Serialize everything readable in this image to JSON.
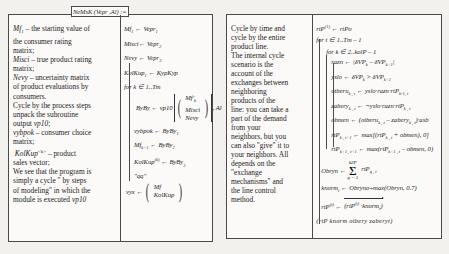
{
  "figure": {
    "kind": "mathcad-pseudocode-figure",
    "panels": 2
  },
  "left_panel": {
    "header": "NeMsK (Vepr ,Al) :=",
    "description": {
      "paragraphs": [
        "Mf1 – the starting value of the consumer rating matrix;",
        "Misci – true product rating matrix;",
        "Nevy – uncertainty matrix of product evaluations by consumers.",
        "Cycle by the process steps unpack the subroutine output vp10;",
        "vybpok – consumer choice matrix;",
        "KolKup<k> – product sales vector;",
        "We see that the program is simply a cycle \" by steps of modeling\" in which the module is executed vp10"
      ],
      "lines": [
        "Mf1 – the starting value of",
        "the consumer rating",
        "matrix;",
        "Misci – true product rating",
        "matrix;",
        "Nevy – uncertainty matrix",
        "of product evaluations by",
        "consumers.",
        "Cycle by the process steps",
        "unpack the subroutine",
        "output vp10;",
        "vybpok – consumer choice",
        "matrix;",
        "KolKup<k> – product",
        "sales vector;",
        "We see that the program is",
        "simply a cycle \" by steps",
        "of modeling\" in which the",
        "module is executed vp10"
      ]
    },
    "code": {
      "lines": [
        "Mf1 ← Vepr1",
        "Misci ← Vepr2",
        "Nevy ← Vepr3",
        "KolKup1 ← KypKyp",
        "for k ∈ 1..Tm",
        "ByBy ← vp10",
        "Mf'k",
        "Misci",
        "Nevy",
        ", Al",
        "vybpok ← ByBy1",
        "Mfk+1 ← ByBy2",
        "KolKup(k) ← ByBy3",
        "\"qq\"",
        "vyx ←",
        "Mf",
        "KolKup"
      ]
    }
  },
  "right_panel": {
    "header": "Lok2(rtPo,VP ,asb) :=",
    "description": {
      "lines": [
        "Cycle by time and",
        "cycle by the entire",
        "product line.",
        "The internal cycle",
        "scenario is the",
        "account of the",
        "exchanges between",
        "neighboring",
        "products of the",
        "line: you can take a",
        "part of the demand",
        "from your",
        "neighbors, but you",
        "can also \"give\" it to",
        "your neighbors. All",
        "depends on the",
        "\"exchange",
        "mechanisms\" and",
        "the line control",
        "method."
      ]
    },
    "code": {
      "lines": [
        "rtP(1) ← rtPo",
        "for t ∈ 1..Tm – 1",
        "for k ∈ 2..kolP – 1",
        "razn ← |δVPk – δVPk+1|",
        "yslo ← δVPk > δVPk+1",
        "otheru k,t ← yslo·razn·rtPk,t",
        "zaberyk,t ← ¬yslo·razn·rtPk,t",
        "obmen ← (otheru k,t – zaberyk,t)·asb",
        "rtPk,t+1 ← max[(rtPk,t + obmen), 0]",
        "rtPk+1,t+1 ← max(rtPk+1,t – obmen, 0)",
        "k2P",
        "Obryn ← Σ rtPq,t",
        "q = 1",
        "knormt ← Obryno÷max(Obryn, 0.7)",
        "rtP(t) ← (rtP(t) ·knormt)",
        "(rtP  knorm  otbery  zaberyt)"
      ]
    }
  },
  "colors": {
    "ink": "#1b1b1b",
    "rule": "#4a4a4a",
    "page": "#fbfaf8",
    "backdrop": "#efefec"
  }
}
